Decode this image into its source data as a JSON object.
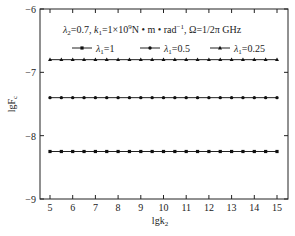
{
  "chart_data": {
    "type": "line",
    "title": "",
    "annotation": "λ2=0.7, k1=1×10^9 N·m·rad^-1, Ω=1/2π GHz",
    "xlabel": "lgk2",
    "ylabel": "lgFc",
    "xlim": [
      4.5,
      15.5
    ],
    "ylim": [
      -9,
      -6
    ],
    "xticks": [
      5,
      6,
      7,
      8,
      9,
      10,
      11,
      12,
      13,
      14,
      15
    ],
    "yticks": [
      -6,
      -7,
      -8,
      -9
    ],
    "grid": false,
    "legend_position": "top",
    "x": [
      5,
      5.5,
      6,
      6.5,
      7,
      7.5,
      8,
      8.5,
      9,
      9.5,
      10,
      10.5,
      11,
      11.5,
      12,
      12.5,
      13,
      13.5,
      14,
      14.5,
      15
    ],
    "series": [
      {
        "name": "λ1=1",
        "marker": "square",
        "values": [
          -8.25,
          -8.25,
          -8.25,
          -8.25,
          -8.25,
          -8.25,
          -8.25,
          -8.25,
          -8.25,
          -8.25,
          -8.25,
          -8.25,
          -8.25,
          -8.25,
          -8.25,
          -8.25,
          -8.25,
          -8.25,
          -8.25,
          -8.25,
          -8.25
        ]
      },
      {
        "name": "λ1=0.5",
        "marker": "circle",
        "values": [
          -7.4,
          -7.4,
          -7.4,
          -7.4,
          -7.4,
          -7.4,
          -7.4,
          -7.4,
          -7.4,
          -7.4,
          -7.4,
          -7.4,
          -7.4,
          -7.4,
          -7.4,
          -7.4,
          -7.4,
          -7.4,
          -7.4,
          -7.4,
          -7.4
        ]
      },
      {
        "name": "λ1=0.25",
        "marker": "triangle",
        "values": [
          -6.8,
          -6.8,
          -6.8,
          -6.8,
          -6.8,
          -6.8,
          -6.8,
          -6.8,
          -6.8,
          -6.8,
          -6.8,
          -6.8,
          -6.8,
          -6.8,
          -6.8,
          -6.8,
          -6.8,
          -6.8,
          -6.8,
          -6.8,
          -6.8
        ]
      }
    ]
  },
  "labels": {
    "annotation_parts": {
      "a": "λ",
      "a_sub": "2",
      "b": "=0.7, ",
      "c": "k",
      "c_sub": "1",
      "d": "=1×10",
      "d_sup": "9",
      "e": "N • m • rad",
      "e_sup": "−1",
      "f": ", Ω=1/2π GHz"
    },
    "legend": [
      {
        "sym": "λ",
        "sub": "1",
        "val": "=1"
      },
      {
        "sym": "λ",
        "sub": "1",
        "val": "=0.5"
      },
      {
        "sym": "λ",
        "sub": "1",
        "val": "=0.25"
      }
    ],
    "xlabel_main": "lgk",
    "xlabel_sub": "2",
    "ylabel_main": "lgF",
    "ylabel_sub": "c"
  }
}
